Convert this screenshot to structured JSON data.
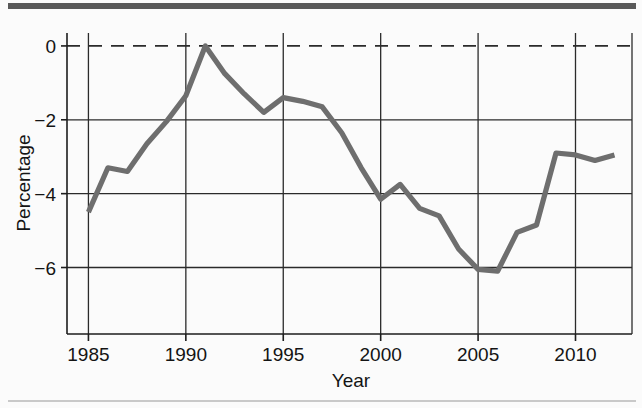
{
  "figure": {
    "top_rule_color": "#595959",
    "bottom_rule_color": "#c9c9c9",
    "background_color": "#fbfbfb"
  },
  "chart_data": {
    "type": "line",
    "title": "",
    "xlabel": "Year",
    "ylabel": "Percentage",
    "xlim": [
      1983.9,
      2012.9
    ],
    "ylim": [
      -7.8,
      0.35
    ],
    "xticks": [
      1985,
      1990,
      1995,
      2000,
      2005,
      2010
    ],
    "xtick_labels": [
      "1985",
      "1990",
      "1995",
      "2000",
      "2005",
      "2010"
    ],
    "yticks": [
      0,
      -2,
      -4,
      -6
    ],
    "ytick_labels": [
      "0",
      "−2",
      "−4",
      "−6"
    ],
    "grid": true,
    "legend": null,
    "zero_reference_line": {
      "value": 0,
      "style": "dashed"
    },
    "line_color": "#6e6e6e",
    "x": [
      1985,
      1986,
      1987,
      1988,
      1989,
      1990,
      1991,
      1992,
      1993,
      1994,
      1995,
      1996,
      1997,
      1998,
      1999,
      2000,
      2001,
      2002,
      2003,
      2004,
      2005,
      2006,
      2007,
      2008,
      2009,
      2010,
      2011,
      2012
    ],
    "values": [
      -4.5,
      -3.3,
      -3.4,
      -2.65,
      -2.05,
      -1.35,
      0.0,
      -0.75,
      -1.3,
      -1.8,
      -1.4,
      -1.5,
      -1.65,
      -2.35,
      -3.3,
      -4.15,
      -3.75,
      -4.4,
      -4.6,
      -5.5,
      -6.05,
      -6.1,
      -5.05,
      -4.85,
      -2.9,
      -2.95,
      -3.1,
      -2.95
    ],
    "series": [
      {
        "name": "Percentage",
        "values": [
          -4.5,
          -3.3,
          -3.4,
          -2.65,
          -2.05,
          -1.35,
          0.0,
          -0.75,
          -1.3,
          -1.8,
          -1.4,
          -1.5,
          -1.65,
          -2.35,
          -3.3,
          -4.15,
          -3.75,
          -4.4,
          -4.6,
          -5.5,
          -6.05,
          -6.1,
          -5.05,
          -4.85,
          -2.9,
          -2.95,
          -3.1,
          -2.95
        ]
      }
    ]
  }
}
